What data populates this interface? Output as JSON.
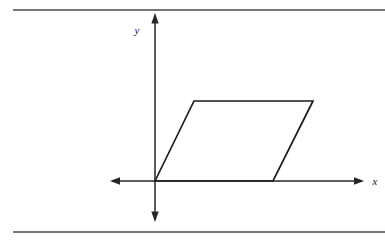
{
  "figure": {
    "title": "",
    "canvas": {
      "width": 385,
      "height": 244,
      "background": "#ffffff"
    },
    "rules": {
      "top": {
        "name": "top-rule",
        "x1": 13,
        "y1": 10,
        "x2": 385,
        "y2": 10,
        "color": "#4a4a4a",
        "width": 1.6
      },
      "bottom": {
        "name": "bottom-rule",
        "x1": 13,
        "y1": 232,
        "x2": 385,
        "y2": 232,
        "color": "#4a4a4a",
        "width": 1.6
      }
    },
    "axes": {
      "origin": {
        "x": 155,
        "y": 181
      },
      "color": "#262626",
      "width": 1.5,
      "x_axis": {
        "label": "x",
        "label_x": 375,
        "label_y": 185,
        "start_x": 112,
        "end_x": 362,
        "y": 181,
        "arrow_left": true,
        "arrow_right": true
      },
      "y_axis": {
        "label": "y",
        "label_x": 137,
        "label_y": 34,
        "top_y": 15,
        "bottom_y": 220,
        "x": 155,
        "arrow_up": true,
        "arrow_down": true
      }
    },
    "shapes": [
      {
        "name": "parallelogram",
        "type": "polygon",
        "fill": "none",
        "stroke": "#1a1a1a",
        "stroke_width": 1.7,
        "vertices": [
          {
            "label": "origin-vertex",
            "x": 155,
            "y": 181
          },
          {
            "label": "top-left-vertex",
            "x": 194,
            "y": 101
          },
          {
            "label": "top-right-vertex",
            "x": 313,
            "y": 101
          },
          {
            "label": "bottom-right-vertex",
            "x": 273,
            "y": 181
          }
        ]
      }
    ]
  }
}
